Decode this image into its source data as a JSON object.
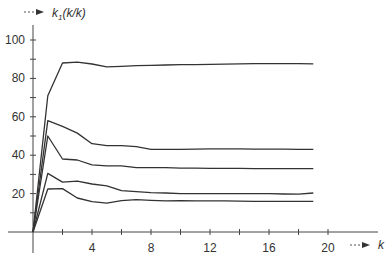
{
  "chart_data": {
    "type": "line",
    "title": "",
    "xlabel": "k",
    "ylabel": "k1(k/k)",
    "ylabel_main": "k",
    "ylabel_sub": "1",
    "ylabel_rest": "(k/k)",
    "xlim": [
      0,
      21
    ],
    "ylim": [
      0,
      105
    ],
    "x_ticks": [
      0,
      2,
      4,
      6,
      8,
      10,
      12,
      14,
      16,
      18,
      20
    ],
    "x_tick_labels": [
      "",
      "",
      "4",
      "",
      "8",
      "",
      "12",
      "",
      "16",
      "",
      "20"
    ],
    "y_ticks": [
      0,
      10,
      20,
      30,
      40,
      50,
      60,
      70,
      80,
      90,
      100
    ],
    "y_tick_labels": [
      "",
      "",
      "20",
      "",
      "40",
      "",
      "60",
      "",
      "80",
      "",
      "100"
    ],
    "grid": false,
    "legend": null,
    "x": [
      0,
      1,
      2,
      3,
      4,
      5,
      6,
      7,
      8,
      9,
      10,
      11,
      12,
      13,
      14,
      15,
      16,
      17,
      18,
      19
    ],
    "series": [
      {
        "name": "curve-1",
        "values": [
          0,
          71,
          88,
          88.5,
          87.5,
          86,
          86.3,
          86.6,
          86.8,
          87,
          87.2,
          87.2,
          87.3,
          87.4,
          87.6,
          87.7,
          87.7,
          87.7,
          87.7,
          87.6
        ]
      },
      {
        "name": "curve-2",
        "values": [
          0,
          58,
          55,
          51.5,
          46,
          45,
          45,
          44.5,
          43,
          43,
          43,
          43.2,
          43.3,
          43.3,
          43.3,
          43.2,
          43.2,
          43.1,
          43,
          43
        ]
      },
      {
        "name": "curve-3",
        "values": [
          0,
          50,
          38,
          37.5,
          35,
          34.5,
          34.5,
          33.5,
          33.5,
          33.5,
          33.3,
          33.3,
          33.2,
          33.2,
          33.1,
          33,
          33,
          33,
          33,
          33
        ]
      },
      {
        "name": "curve-4",
        "values": [
          0,
          30.5,
          26,
          26.5,
          25,
          24,
          21.5,
          21,
          20.5,
          20.3,
          20,
          20,
          20,
          20,
          20,
          20,
          20,
          19.8,
          19.7,
          20.3
        ]
      },
      {
        "name": "curve-5",
        "values": [
          0,
          22.4,
          22.6,
          17.7,
          15.8,
          15,
          16.3,
          16.8,
          16.5,
          16.2,
          16.3,
          16.2,
          16.2,
          16.2,
          16.1,
          16,
          16,
          16,
          16,
          16
        ]
      }
    ],
    "line_color": "#333333"
  }
}
